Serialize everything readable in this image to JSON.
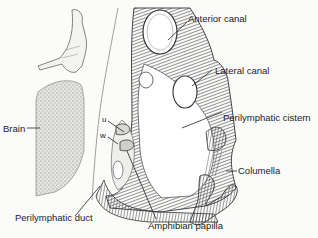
{
  "figure": {
    "colors": {
      "ink": "#222222",
      "hatch": "#4a4a4a",
      "stipple": "#9a9a9a",
      "background": "#fbfbfa",
      "cavity": "#ffffff"
    }
  },
  "labels": {
    "anterior_canal": "Anterior canal",
    "lateral_canal": "Lateral canal",
    "perilymphatic_cistern": "Perilymphatic cistern",
    "columella": "Columella",
    "brain": "Brain",
    "perilymphatic_duct": "Perilymphatic duct",
    "amphibian_papilla": "Amphibian papilla",
    "u": "u",
    "w": "w"
  }
}
